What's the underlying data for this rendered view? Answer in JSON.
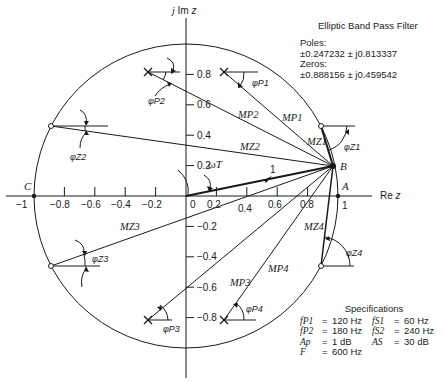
{
  "figure": {
    "title": "Elliptic Band Pass Filter",
    "poles_label": "Poles:",
    "poles_value": "±0.247232  ± j0.813337",
    "zeros_label": "Zeros:",
    "zeros_value": "±0.888156  ± j0.459542",
    "axes": {
      "imag_label": "j Im z",
      "real_label": "Re z",
      "x_ticks": [
        "−1",
        "−0.8",
        "−0.6",
        "−0.4",
        "−0.2",
        "0",
        "0.2",
        "0.4",
        "0.6",
        "0.8",
        "1"
      ],
      "y_ticks_pos": [
        "0.8",
        "0.6",
        "0.4",
        "0.2"
      ],
      "y_ticks_neg": [
        "−0.2",
        "−0.4",
        "−0.6",
        "−0.8"
      ]
    },
    "points": {
      "A": "A",
      "B": "B",
      "C": "C"
    },
    "vector_labels": {
      "MP1": "MP1",
      "MP2": "MP2",
      "MP3": "MP3",
      "MP4": "MP4",
      "MZ1": "MZ1",
      "MZ2": "MZ2",
      "MZ3": "MZ3",
      "MZ4": "MZ4",
      "unit": "1",
      "omegaT": "ωT"
    },
    "angle_labels": {
      "phiP1": "φP1",
      "phiP2": "φP2",
      "phiP3": "φP3",
      "phiP4": "φP4",
      "phiZ1": "φZ1",
      "phiZ2": "φZ2",
      "phiZ3": "φZ3",
      "phiZ4": "φZ4"
    },
    "specifications": {
      "heading": "Specifications",
      "rows": [
        {
          "left_sym": "fP1",
          "left_val": "120 Hz",
          "right_sym": "fS1",
          "right_val": "60 Hz"
        },
        {
          "left_sym": "fP2",
          "left_val": "180 Hz",
          "right_sym": "fS2",
          "right_val": "240 Hz"
        },
        {
          "left_sym": "Ap",
          "left_val": "1 dB",
          "right_sym": "AS",
          "right_val": "30 dB"
        },
        {
          "left_sym": "F",
          "left_val": "600 Hz",
          "right_sym": "",
          "right_val": ""
        }
      ]
    }
  }
}
